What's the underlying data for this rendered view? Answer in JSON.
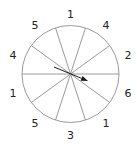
{
  "spinner": {
    "center": [
      70.5,
      74
    ],
    "radius": 48.5,
    "section_count": 10,
    "line_color": "#9a9a9a",
    "arrow_color": "#1a1a1a",
    "sections": [
      {
        "label": "1",
        "angle": 0
      },
      {
        "label": "4",
        "angle": 36
      },
      {
        "label": "2",
        "angle": 72
      },
      {
        "label": "6",
        "angle": 108
      },
      {
        "label": "1",
        "angle": 144
      },
      {
        "label": "3",
        "angle": 180
      },
      {
        "label": "5",
        "angle": 216
      },
      {
        "label": "1",
        "angle": 252
      },
      {
        "label": "4",
        "angle": 288
      },
      {
        "label": "5",
        "angle": 324
      }
    ],
    "arrow": {
      "from": [
        54,
        67
      ],
      "to": [
        88,
        81
      ]
    }
  }
}
